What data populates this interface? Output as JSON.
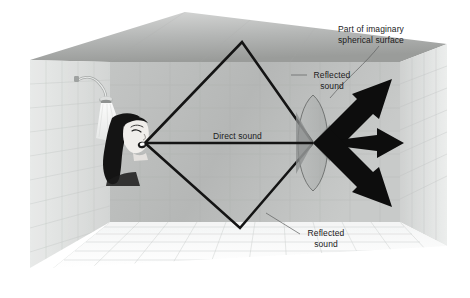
{
  "figure": {
    "background_color": "#ffffff"
  },
  "labels": {
    "imaginary_surface_line1": "Part of imaginary",
    "imaginary_surface_line2": "spherical surface",
    "reflected_sound_upper_line1": "Reflected",
    "reflected_sound_upper_line2": "sound",
    "direct_sound": "Direct sound",
    "reflected_sound_lower_line1": "Reflected",
    "reflected_sound_lower_line2": "sound"
  },
  "colors": {
    "ink": "#1b1b1b",
    "ray": "#111111",
    "leader": "#6a6a6a",
    "ceiling_light": "#cfd0cf",
    "ceiling_dark": "#9a9c9a",
    "back_wall": "#b6b8b7",
    "left_wall": "#d8dad9",
    "right_wall": "#d2d4d3",
    "floor": "#fbfbfb",
    "tile_line": "#b9bcbb",
    "wedge": "#8f9291",
    "lens_fill": "#a8abaa"
  },
  "geometry": {
    "sound_origin": [
      145,
      143
    ],
    "focus_point": [
      313,
      143
    ],
    "diamond_top_vertex": [
      242,
      42
    ],
    "diamond_bottom_vertex": [
      240,
      228
    ],
    "arrow_count": 3,
    "arrow_directions": [
      "up-right",
      "right",
      "down-right"
    ]
  },
  "scene_elements": {
    "shower_head": "shower-head",
    "person": "singing-person",
    "walls": [
      "left-wall",
      "back-wall",
      "right-wall"
    ],
    "ceiling": "ceiling",
    "floor": "floor"
  }
}
